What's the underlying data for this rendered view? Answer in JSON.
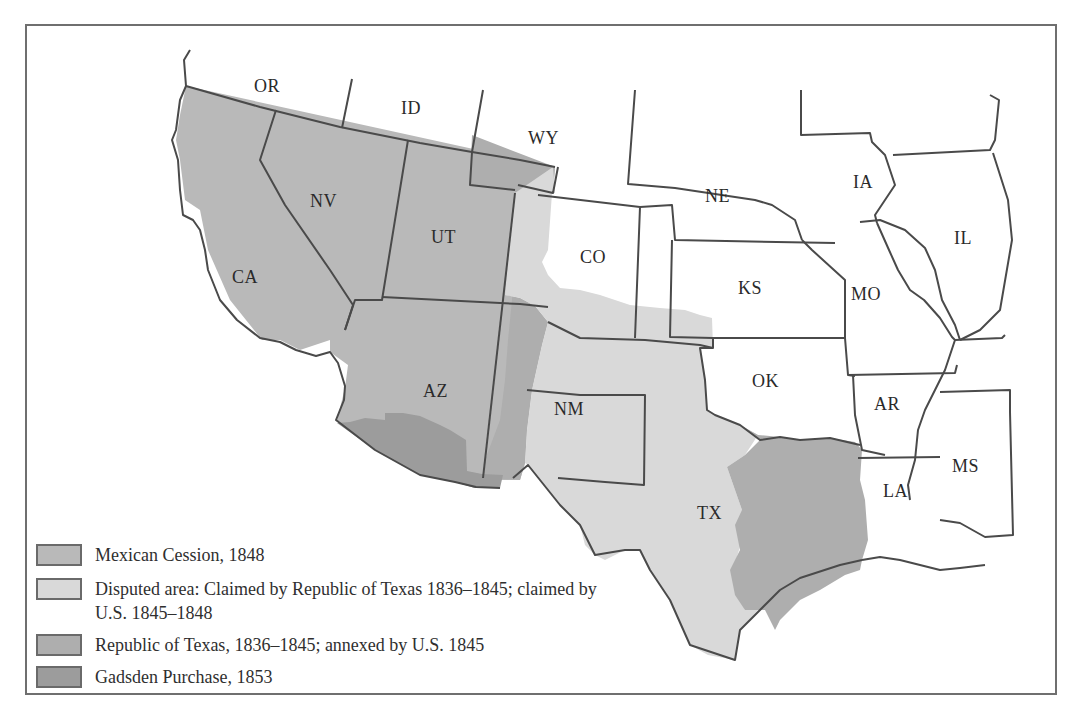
{
  "map": {
    "states": [
      {
        "abbr": "OR",
        "x": 254,
        "y": 92
      },
      {
        "abbr": "ID",
        "x": 401,
        "y": 114
      },
      {
        "abbr": "WY",
        "x": 528,
        "y": 144
      },
      {
        "abbr": "NV",
        "x": 310,
        "y": 207
      },
      {
        "abbr": "UT",
        "x": 431,
        "y": 243
      },
      {
        "abbr": "CO",
        "x": 580,
        "y": 263
      },
      {
        "abbr": "NE",
        "x": 705,
        "y": 202
      },
      {
        "abbr": "IA",
        "x": 853,
        "y": 188
      },
      {
        "abbr": "IL",
        "x": 954,
        "y": 244
      },
      {
        "abbr": "KS",
        "x": 738,
        "y": 294
      },
      {
        "abbr": "MO",
        "x": 851,
        "y": 300
      },
      {
        "abbr": "CA",
        "x": 232,
        "y": 283
      },
      {
        "abbr": "AZ",
        "x": 423,
        "y": 397
      },
      {
        "abbr": "NM",
        "x": 554,
        "y": 415
      },
      {
        "abbr": "OK",
        "x": 752,
        "y": 387
      },
      {
        "abbr": "AR",
        "x": 874,
        "y": 410
      },
      {
        "abbr": "TX",
        "x": 697,
        "y": 519
      },
      {
        "abbr": "LA",
        "x": 883,
        "y": 497
      },
      {
        "abbr": "MS",
        "x": 952,
        "y": 472
      }
    ]
  },
  "legend": {
    "items": [
      {
        "label": "Mexican Cession, 1848",
        "color": "#b9b9b9"
      },
      {
        "label": "Disputed area: Claimed by Republic of Texas 1836–1845; claimed by U.S. 1845–1848",
        "color": "#d9d9d9"
      },
      {
        "label": "Republic of Texas, 1836–1845; annexed by U.S. 1845",
        "color": "#aeaeae"
      },
      {
        "label": "Gadsden Purchase, 1853",
        "color": "#9c9c9c"
      }
    ]
  },
  "colors": {
    "mexican_cession": "#b9b9b9",
    "disputed": "#d9d9d9",
    "republic_texas": "#aeaeae",
    "gadsden": "#9c9c9c",
    "border": "#4a4a4a"
  }
}
